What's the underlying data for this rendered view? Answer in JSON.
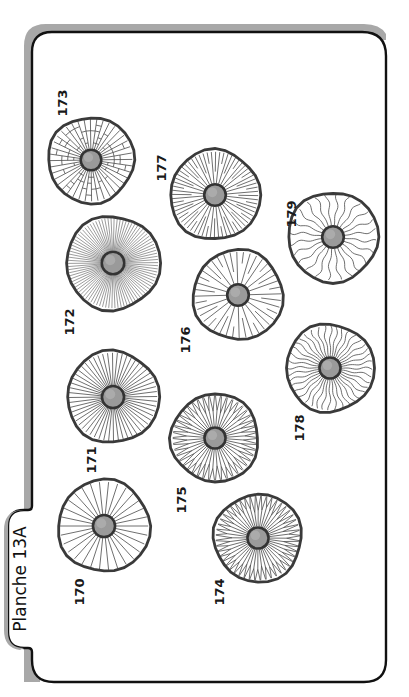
{
  "plate": {
    "title": "Planche 13A",
    "orientation": "rotated-90-ccw",
    "colors": {
      "frame_stroke": "#111111",
      "frame_shadow": "#a8a8a8",
      "cap_outline": "#3a3a3a",
      "gill_line": "#4a4a4a",
      "stem_fill": "#9a9a9a",
      "stem_ring": "#333333",
      "background": "#ffffff"
    }
  },
  "caps": [
    {
      "id": "170",
      "label": "170",
      "cx": 104,
      "cy": 526,
      "r": 46,
      "pattern": "sparse-straight",
      "lines": 30,
      "lx": 84,
      "ly": 592
    },
    {
      "id": "171",
      "label": "171",
      "cx": 113,
      "cy": 397,
      "r": 46,
      "pattern": "dense-straight",
      "lines": 56,
      "lx": 96,
      "ly": 460
    },
    {
      "id": "172",
      "label": "172",
      "cx": 113,
      "cy": 263,
      "r": 47,
      "pattern": "very-dense-straight",
      "lines": 90,
      "lx": 74,
      "ly": 322
    },
    {
      "id": "173",
      "label": "173",
      "cx": 91,
      "cy": 160,
      "r": 43,
      "pattern": "reticulate",
      "lines": 40,
      "lx": 67,
      "ly": 103
    },
    {
      "id": "174",
      "label": "174",
      "cx": 258,
      "cy": 538,
      "r": 44,
      "pattern": "forked-wavy",
      "lines": 48,
      "lx": 224,
      "ly": 592
    },
    {
      "id": "175",
      "label": "175",
      "cx": 215,
      "cy": 438,
      "r": 44,
      "pattern": "forked",
      "lines": 44,
      "lx": 186,
      "ly": 500
    },
    {
      "id": "176",
      "label": "176",
      "cx": 238,
      "cy": 295,
      "r": 45,
      "pattern": "alternating-lamellulae",
      "lines": 40,
      "lx": 190,
      "ly": 340
    },
    {
      "id": "177",
      "label": "177",
      "cx": 215,
      "cy": 195,
      "r": 45,
      "pattern": "straight-with-lamellulae",
      "lines": 64,
      "lx": 166,
      "ly": 168
    },
    {
      "id": "178",
      "label": "178",
      "cx": 330,
      "cy": 368,
      "r": 44,
      "pattern": "wavy-dense",
      "lines": 40,
      "lx": 304,
      "ly": 428
    },
    {
      "id": "179",
      "label": "179",
      "cx": 333,
      "cy": 237,
      "r": 45,
      "pattern": "wavy-sparse",
      "lines": 24,
      "lx": 296,
      "ly": 214
    }
  ]
}
